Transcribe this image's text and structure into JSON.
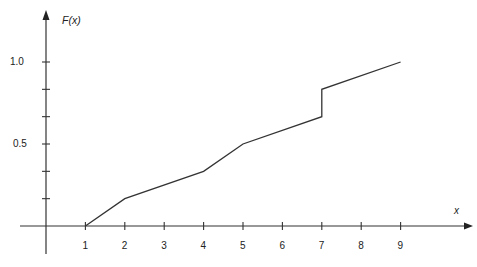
{
  "chart_data": {
    "type": "line",
    "title": "",
    "xlabel": "x",
    "ylabel": "F(x)",
    "x_ticks": [
      1,
      2,
      3,
      4,
      5,
      6,
      7,
      8,
      9
    ],
    "x_tick_labels": [
      "1",
      "2",
      "3",
      "4",
      "5",
      "6",
      "7",
      "8",
      "9"
    ],
    "y_ticks": [
      0.1667,
      0.3333,
      0.5,
      0.6667,
      0.8333,
      1.0
    ],
    "y_tick_labels": [
      "",
      "",
      "0.5",
      "",
      "",
      "1.0"
    ],
    "xlim": [
      -1,
      10
    ],
    "ylim": [
      0,
      1.2
    ],
    "grid": false,
    "legend": null,
    "series": [
      {
        "name": "F(x)",
        "points": [
          {
            "x": 1,
            "y": 0.0
          },
          {
            "x": 2,
            "y": 0.1667
          },
          {
            "x": 4,
            "y": 0.3333
          },
          {
            "x": 5,
            "y": 0.5
          },
          {
            "x": 7,
            "y": 0.6667
          },
          {
            "x": 7,
            "y": 0.8333
          },
          {
            "x": 9,
            "y": 1.0
          }
        ]
      }
    ],
    "annotations": [
      "Vertical jump at x = 7 from 0.667 to 0.833"
    ]
  },
  "labels": {
    "y_axis": "F(x)",
    "x_axis": "x",
    "y_1": "1.0",
    "y_05": "0.5"
  }
}
